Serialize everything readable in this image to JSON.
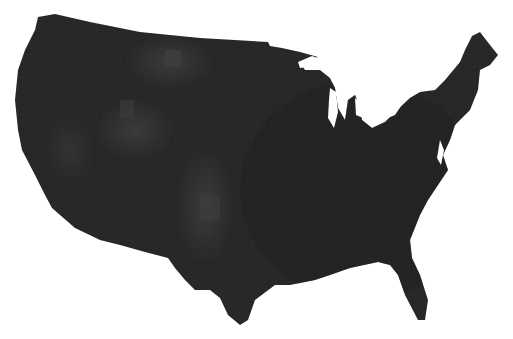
{
  "map": {
    "type": "choropleth",
    "region": "Contiguous United States",
    "granularity": "county",
    "colors": {
      "background": "#ffffff",
      "base_fill": "#272727",
      "dark_fill": "#222222",
      "light_fill": "#3a3a3a",
      "lighter_fill": "#444444"
    },
    "lighter_regions": [
      {
        "name": "Northern Rockies / Montana",
        "cx": 170,
        "cy": 60
      },
      {
        "name": "Great Basin / Utah-Colorado",
        "cx": 135,
        "cy": 130
      },
      {
        "name": "Central Plains corridor",
        "cx": 205,
        "cy": 200
      }
    ]
  }
}
